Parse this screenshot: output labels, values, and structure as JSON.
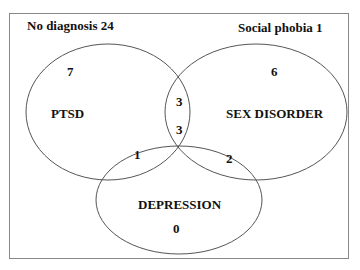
{
  "diagram": {
    "type": "venn",
    "corner_labels": {
      "top_left": "No diagnosis 24",
      "top_right": "Social phobia 1"
    },
    "sets": [
      {
        "name": "PTSD",
        "only_count": "7"
      },
      {
        "name": "SEX DISORDER",
        "only_count": "6"
      },
      {
        "name": "DEPRESSION",
        "only_count": "0"
      }
    ],
    "intersections": {
      "ptsd_sex": "3",
      "ptsd_sex_depression": "3",
      "ptsd_depression": "1",
      "sex_depression": "2"
    },
    "colors": {
      "line": "#555555",
      "text": "#111111",
      "background": "#ffffff"
    }
  }
}
